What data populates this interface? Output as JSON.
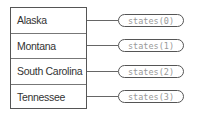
{
  "diagram": {
    "rows": [
      {
        "label": "Alaska",
        "ref": "states(0)"
      },
      {
        "label": "Montana",
        "ref": "states(1)"
      },
      {
        "label": "South Carolina",
        "ref": "states(2)"
      },
      {
        "label": "Tennessee",
        "ref": "states(3)"
      }
    ]
  }
}
